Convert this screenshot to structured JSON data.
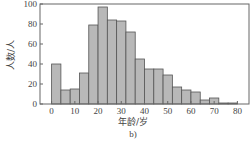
{
  "chart_data": {
    "type": "bar",
    "title": "",
    "xlabel": "年龄/岁",
    "ylabel": "人数/人",
    "caption": "b)",
    "bin_width": 4,
    "bin_edges": [
      0,
      4,
      8,
      12,
      16,
      20,
      24,
      28,
      32,
      36,
      40,
      44,
      48,
      52,
      56,
      60,
      64,
      68,
      72,
      76,
      80
    ],
    "values": [
      40,
      14,
      15,
      31,
      79,
      97,
      84,
      83,
      72,
      45,
      35,
      35,
      29,
      17,
      14,
      12,
      4,
      6,
      1,
      1
    ],
    "xlim": [
      -5,
      85
    ],
    "ylim": [
      0,
      100
    ],
    "xticks": [
      0,
      10,
      20,
      30,
      40,
      50,
      60,
      70,
      80
    ],
    "yticks": [
      0,
      20,
      40,
      60,
      80,
      100
    ],
    "grid": false,
    "legend": null,
    "bar_color": "#b8b8b8",
    "edge_color": "#555555"
  }
}
